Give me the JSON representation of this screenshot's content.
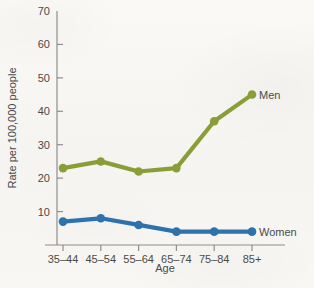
{
  "chart_data": {
    "type": "line",
    "title": "",
    "xlabel": "Age",
    "ylabel": "Rate per 100,000 people",
    "categories": [
      "35–44",
      "45–54",
      "55–64",
      "65–74",
      "75–84",
      "85+"
    ],
    "series": [
      {
        "name": "Men",
        "color": "#8a9e38",
        "values": [
          23,
          25,
          22,
          23,
          37,
          45
        ]
      },
      {
        "name": "Women",
        "color": "#2d72ad",
        "values": [
          7,
          8,
          6,
          4,
          4,
          4
        ]
      }
    ],
    "ylim": [
      0,
      70
    ],
    "yticks": [
      10,
      20,
      30,
      40,
      50,
      60,
      70
    ],
    "ytick_labels": [
      "10",
      "20",
      "30",
      "40",
      "50",
      "60",
      "70"
    ],
    "grid": false,
    "legend_position": "inline-right-of-series-end"
  },
  "axes": {
    "x_title": "Age",
    "y_title": "Rate per 100,000 people"
  },
  "annotations": {
    "men_label": "Men",
    "women_label": "Women"
  },
  "colors": {
    "men": "#8a9e38",
    "women": "#2d72ad",
    "axis": "#8e8e8e",
    "text": "#4a4a4a",
    "background": "#f7f6f2"
  }
}
